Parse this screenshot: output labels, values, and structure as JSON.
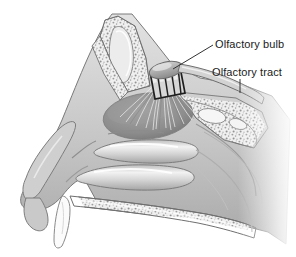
{
  "figure": {
    "kind": "anatomical-illustration",
    "background_color": "#ffffff",
    "width": 296,
    "height": 257,
    "palette": {
      "background": "#ffffff",
      "outline": "#6b6b6b",
      "tissue_light": "#d8d8d8",
      "tissue_mid": "#b9b9b9",
      "tissue_dark": "#9a9a9a",
      "epithelium": "#8d8d8d",
      "bone_fill": "#efefef",
      "bone_speckle": "#9b9b9b",
      "cribriform_plate": "#2a2a2a",
      "highlight": "#f4f4f4",
      "label_text": "#1a1a1a",
      "leader_line": "#333333"
    }
  },
  "labels": [
    {
      "id": "olfactory-bulb",
      "text": "Olfactory bulb",
      "x": 215,
      "y": 38,
      "leader": {
        "type": "diagonal",
        "x1": 213,
        "y1": 45,
        "x2": 173,
        "y2": 69
      }
    },
    {
      "id": "olfactory-tract",
      "text": "Olfactory tract",
      "x": 212,
      "y": 66,
      "leader": {
        "type": "vertical",
        "x1": 240,
        "y1": 79,
        "x2": 240,
        "y2": 93
      }
    }
  ],
  "structures": [
    {
      "id": "frontal-sinus",
      "name": "Frontal sinus"
    },
    {
      "id": "cribriform-plate",
      "name": "Cribriform plate"
    },
    {
      "id": "olfactory-bulb-body",
      "name": "Olfactory bulb"
    },
    {
      "id": "olfactory-tract-body",
      "name": "Olfactory tract"
    },
    {
      "id": "olfactory-epithelium",
      "name": "Olfactory epithelium"
    },
    {
      "id": "olfactory-nerve-fibers",
      "name": "Olfactory nerve fibers"
    },
    {
      "id": "superior-turbinate",
      "name": "Superior turbinate"
    },
    {
      "id": "middle-turbinate",
      "name": "Middle turbinate"
    },
    {
      "id": "inferior-turbinate",
      "name": "Inferior turbinate"
    },
    {
      "id": "hard-palate",
      "name": "Hard palate"
    },
    {
      "id": "upper-lip",
      "name": "Upper lip"
    },
    {
      "id": "nasal-tip",
      "name": "Nasal tip"
    },
    {
      "id": "sphenoid-region",
      "name": "Sphenoid region"
    },
    {
      "id": "nasopharynx",
      "name": "Nasopharynx"
    }
  ]
}
